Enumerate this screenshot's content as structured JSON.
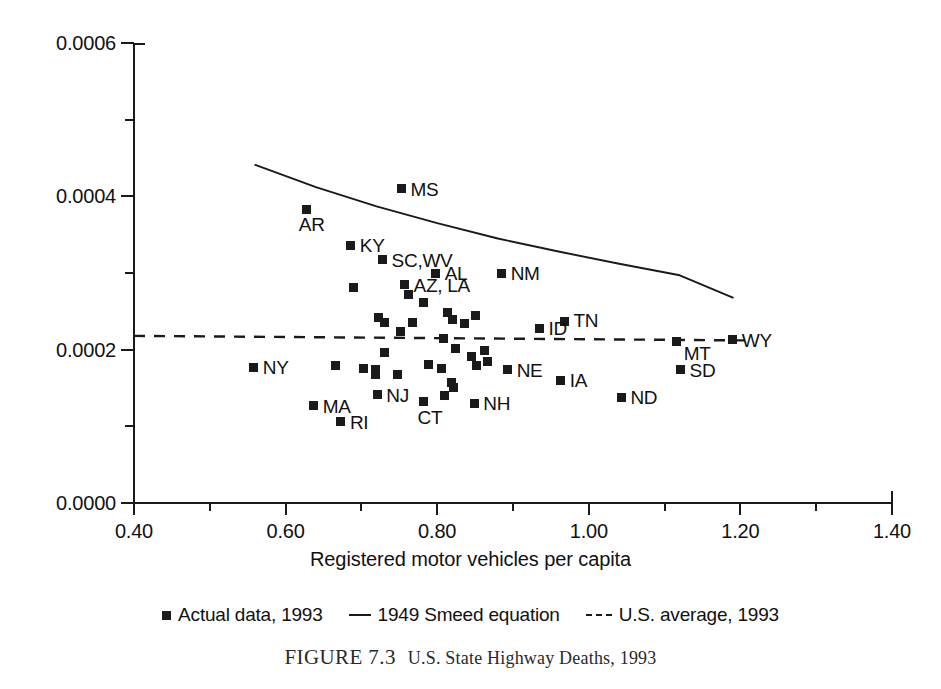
{
  "figure": {
    "caption_number": "FIGURE 7.3",
    "caption_text": "U.S. State Highway Deaths, 1993"
  },
  "axes": {
    "x_title": "Registered motor vehicles per capita",
    "y_title": "Annual highway deaths per vehicle",
    "x_tick_labels": [
      "0.40",
      "0.60",
      "0.80",
      "1.00",
      "1.20",
      "1.40"
    ],
    "y_tick_labels": [
      "0.0000",
      "0.0002",
      "0.0004",
      "0.0006"
    ]
  },
  "legend": {
    "items": [
      {
        "label": "Actual data, 1993",
        "swatch": "square-marker"
      },
      {
        "label": "1949 Smeed equation",
        "swatch": "solid-line"
      },
      {
        "label": "U.S. average, 1993",
        "swatch": "dashed-line"
      }
    ]
  },
  "chart_data": {
    "type": "scatter",
    "title": "U.S. State Highway Deaths, 1993",
    "xlabel": "Registered motor vehicles per capita",
    "ylabel": "Annual highway deaths per vehicle",
    "xlim": [
      0.4,
      1.4
    ],
    "ylim": [
      0.0,
      0.0006
    ],
    "x_major_ticks": [
      0.4,
      0.6,
      0.8,
      1.0,
      1.2,
      1.4
    ],
    "x_minor_ticks": [
      0.5,
      0.7,
      0.9,
      1.1,
      1.3
    ],
    "y_major_ticks": [
      0.0,
      0.0002,
      0.0004,
      0.0006
    ],
    "y_minor_ticks": [
      0.0001,
      0.0003,
      0.0005
    ],
    "grid": false,
    "legend_position": "below-axes",
    "series": [
      {
        "name": "Actual data, 1993",
        "type": "scatter",
        "marker": "filled-square",
        "points": [
          {
            "label": "MS",
            "x": 0.753,
            "y": 0.00041
          },
          {
            "label": "AR",
            "x": 0.628,
            "y": 0.000383
          },
          {
            "label": "KY",
            "x": 0.686,
            "y": 0.000336
          },
          {
            "label": "SC,WV",
            "x": 0.728,
            "y": 0.000317
          },
          {
            "label": "AL",
            "x": 0.798,
            "y": 0.0003
          },
          {
            "label": "NM",
            "x": 0.885,
            "y": 0.0003
          },
          {
            "label": "AZ, LA",
            "x": 0.757,
            "y": 0.000285
          },
          {
            "label": "",
            "x": 0.69,
            "y": 0.000281
          },
          {
            "label": "",
            "x": 0.762,
            "y": 0.000272
          },
          {
            "label": "",
            "x": 0.782,
            "y": 0.000262
          },
          {
            "label": "",
            "x": 0.723,
            "y": 0.000242
          },
          {
            "label": "",
            "x": 0.731,
            "y": 0.000236
          },
          {
            "label": "",
            "x": 0.814,
            "y": 0.000249
          },
          {
            "label": "",
            "x": 0.82,
            "y": 0.00024
          },
          {
            "label": "",
            "x": 0.851,
            "y": 0.000244
          },
          {
            "label": "",
            "x": 0.768,
            "y": 0.000236
          },
          {
            "label": "",
            "x": 0.836,
            "y": 0.000234
          },
          {
            "label": "TN",
            "x": 0.968,
            "y": 0.000237
          },
          {
            "label": "ID",
            "x": 0.935,
            "y": 0.000228
          },
          {
            "label": "",
            "x": 0.752,
            "y": 0.000224
          },
          {
            "label": "",
            "x": 0.808,
            "y": 0.000215
          },
          {
            "label": "MT",
            "x": 1.116,
            "y": 0.000211
          },
          {
            "label": "WY",
            "x": 1.19,
            "y": 0.000213
          },
          {
            "label": "",
            "x": 0.824,
            "y": 0.000202
          },
          {
            "label": "",
            "x": 0.863,
            "y": 0.000199
          },
          {
            "label": "",
            "x": 0.73,
            "y": 0.000196
          },
          {
            "label": "",
            "x": 0.845,
            "y": 0.000191
          },
          {
            "label": "",
            "x": 0.666,
            "y": 0.000179
          },
          {
            "label": "",
            "x": 0.703,
            "y": 0.000176
          },
          {
            "label": "",
            "x": 0.718,
            "y": 0.000174
          },
          {
            "label": "",
            "x": 0.789,
            "y": 0.000181
          },
          {
            "label": "",
            "x": 0.806,
            "y": 0.000175
          },
          {
            "label": "",
            "x": 0.852,
            "y": 0.000179
          },
          {
            "label": "",
            "x": 0.867,
            "y": 0.000184
          },
          {
            "label": "NY",
            "x": 0.558,
            "y": 0.000177
          },
          {
            "label": "NE",
            "x": 0.893,
            "y": 0.000174
          },
          {
            "label": "SD",
            "x": 1.121,
            "y": 0.000174
          },
          {
            "label": "",
            "x": 0.719,
            "y": 0.000168
          },
          {
            "label": "",
            "x": 0.748,
            "y": 0.000168
          },
          {
            "label": "IA",
            "x": 0.963,
            "y": 0.00016
          },
          {
            "label": "",
            "x": 0.819,
            "y": 0.000157
          },
          {
            "label": "",
            "x": 0.821,
            "y": 0.000151
          },
          {
            "label": "NJ",
            "x": 0.721,
            "y": 0.000141
          },
          {
            "label": "",
            "x": 0.81,
            "y": 0.00014
          },
          {
            "label": "ND",
            "x": 1.043,
            "y": 0.000138
          },
          {
            "label": "CT",
            "x": 0.782,
            "y": 0.000133
          },
          {
            "label": "NH",
            "x": 0.849,
            "y": 0.00013
          },
          {
            "label": "MA",
            "x": 0.637,
            "y": 0.000127
          },
          {
            "label": "RI",
            "x": 0.673,
            "y": 0.000106
          }
        ]
      },
      {
        "name": "1949 Smeed equation",
        "type": "line",
        "style": "solid",
        "points": [
          {
            "x": 0.56,
            "y": 0.000441
          },
          {
            "x": 0.64,
            "y": 0.000412
          },
          {
            "x": 0.72,
            "y": 0.000387
          },
          {
            "x": 0.8,
            "y": 0.000365
          },
          {
            "x": 0.88,
            "y": 0.000345
          },
          {
            "x": 0.96,
            "y": 0.000328
          },
          {
            "x": 1.04,
            "y": 0.000312
          },
          {
            "x": 1.12,
            "y": 0.000297
          },
          {
            "x": 1.19,
            "y": 0.000268
          }
        ]
      },
      {
        "name": "U.S. average, 1993",
        "type": "line",
        "style": "dashed",
        "points": [
          {
            "x": 0.4,
            "y": 0.000218
          },
          {
            "x": 1.215,
            "y": 0.000212
          }
        ]
      }
    ]
  },
  "label_offsets": {
    "MS": {
      "dx": 9,
      "dy": -9
    },
    "AR": {
      "dx": -8,
      "dy": 6
    },
    "KY": {
      "dx": 9,
      "dy": -9
    },
    "SC,WV": {
      "dx": 9,
      "dy": -9
    },
    "AL": {
      "dx": 9,
      "dy": -9
    },
    "NM": {
      "dx": 9,
      "dy": -9
    },
    "AZ, LA": {
      "dx": 9,
      "dy": -9
    },
    "TN": {
      "dx": 9,
      "dy": -10
    },
    "ID": {
      "dx": 9,
      "dy": -9
    },
    "MT": {
      "dx": 7,
      "dy": 3
    },
    "WY": {
      "dx": 9,
      "dy": -9
    },
    "NY": {
      "dx": 9,
      "dy": -9
    },
    "NE": {
      "dx": 9,
      "dy": -9
    },
    "SD": {
      "dx": 9,
      "dy": -9
    },
    "IA": {
      "dx": 9,
      "dy": -9
    },
    "NJ": {
      "dx": 9,
      "dy": -9
    },
    "ND": {
      "dx": 9,
      "dy": -9
    },
    "CT": {
      "dx": -6,
      "dy": 7
    },
    "NH": {
      "dx": 9,
      "dy": -9
    },
    "MA": {
      "dx": 9,
      "dy": -9
    },
    "RI": {
      "dx": 9,
      "dy": -9
    }
  },
  "colors": {
    "ink": "#1a1a1a",
    "background": "#ffffff",
    "caption": "#2a2a2a"
  }
}
